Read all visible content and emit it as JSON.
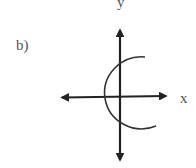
{
  "figure": {
    "part_label": "b)",
    "x_axis_label": "x",
    "y_axis_label": "y",
    "colors": {
      "axes": "#222222",
      "curve": "#333333",
      "labels": "#555555",
      "background": "#ffffff"
    }
  }
}
